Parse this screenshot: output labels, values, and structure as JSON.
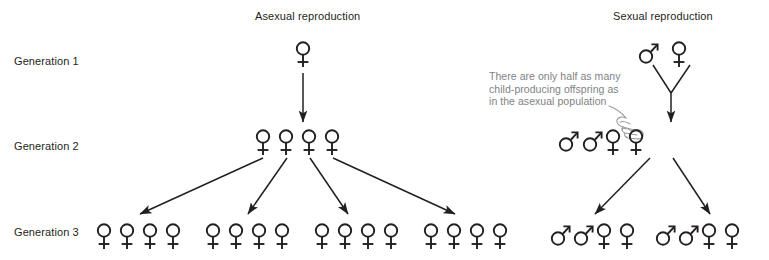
{
  "diagram": {
    "title_asexual": "Asexual reproduction",
    "title_sexual": "Sexual reproduction",
    "generation_labels": [
      "Generation 1",
      "Generation 2",
      "Generation 3"
    ],
    "annotation": {
      "line1": "There are only half as many",
      "line2": "child-producing offspring as",
      "line3": "in the asexual population"
    },
    "colors": {
      "symbol": "#231f20",
      "text": "#231f20",
      "annotation_text": "#808285",
      "arrow": "#231f20",
      "background": "#ffffff"
    },
    "populations": {
      "asexual": {
        "generation_1": {
          "female": 1,
          "male": 0
        },
        "generation_2": {
          "female": 4,
          "male": 0
        },
        "generation_3": {
          "female": 16,
          "male": 0,
          "groups": 4,
          "per_group_female": 4
        }
      },
      "sexual": {
        "generation_1": {
          "female": 1,
          "male": 1
        },
        "generation_2": {
          "female": 2,
          "male": 2
        },
        "generation_3": {
          "female": 4,
          "male": 4,
          "groups": 2,
          "per_group_female": 2,
          "per_group_male": 2
        }
      }
    },
    "icons": {
      "female": "venus-symbol",
      "male": "mars-symbol",
      "pointer": "pointing-hand-icon"
    }
  }
}
